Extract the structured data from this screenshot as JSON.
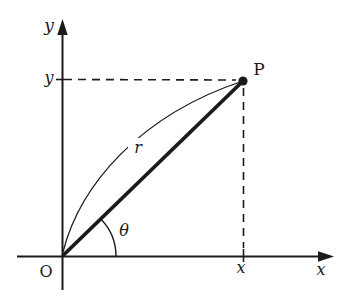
{
  "diagram": {
    "description_labels": {
      "y_axis_label": "y",
      "x_axis_label": "x",
      "y_coordinate_tick_label": "y",
      "x_coordinate_tick_label": "x",
      "origin_label": "O",
      "point_label": "P",
      "radius_label": "r",
      "angle_label": "θ"
    }
  },
  "colors": {
    "ink": "#1b1b1b",
    "background": "#ffffff"
  }
}
